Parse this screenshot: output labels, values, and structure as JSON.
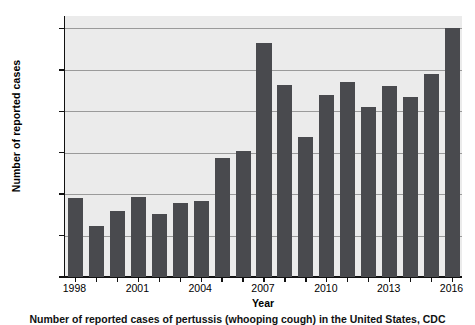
{
  "figure": {
    "caption": "Number of reported cases of pertussis (whooping cough) in the United States, CDC"
  },
  "chart_data": {
    "type": "bar",
    "title": "",
    "xlabel": "Year",
    "ylabel": "Number of reported cases",
    "categories": [
      1998,
      1999,
      2000,
      2001,
      2002,
      2003,
      2004,
      2005,
      2006,
      2007,
      2008,
      2009,
      2010,
      2011,
      2012,
      2013,
      2014,
      2015,
      2016
    ],
    "values": [
      3800,
      2450,
      3200,
      3850,
      3050,
      3550,
      3650,
      5750,
      6100,
      11300,
      9250,
      6750,
      8800,
      9400,
      8200,
      9200,
      8700,
      9800,
      12000
    ],
    "ylim": [
      0,
      12600
    ],
    "yticks": [
      0,
      2000,
      4000,
      6000,
      8000,
      10000,
      12000
    ],
    "ytick_labels": [
      "0",
      "2,000",
      "4,000",
      "6,000",
      "8,000",
      "10,000",
      "12,000"
    ],
    "xticks": [
      1998,
      2001,
      2004,
      2007,
      2010,
      2013,
      2016
    ],
    "xtick_labels": [
      "1998",
      "2001",
      "2004",
      "2007",
      "2010",
      "2013",
      "2016"
    ],
    "grid": true,
    "legend": false,
    "bar_color": "#494a4e",
    "plot_background": "#ebebeb",
    "gridline_color": "#9a9a9a"
  }
}
